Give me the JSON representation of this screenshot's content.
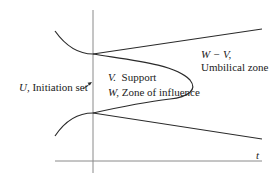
{
  "diagram": {
    "type": "phase-portrait-schematic",
    "axis_label_t": "t",
    "labels": {
      "initiation": {
        "symbol": "U,",
        "text": " Initiation set"
      },
      "support": {
        "symbol": "V.",
        "text": "  Support"
      },
      "influence": {
        "symbol": "W,",
        "text": " Zone of influence"
      },
      "umbilical_symbol": "W − V,",
      "umbilical_text": "Umbilical zone"
    },
    "colors": {
      "line": "#2a2a2a",
      "axis": "#8a8a8a",
      "text": "#222222",
      "background": "#ffffff"
    }
  }
}
